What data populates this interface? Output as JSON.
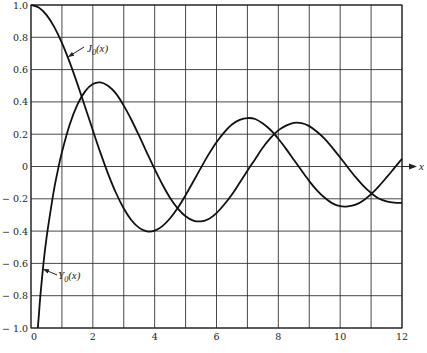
{
  "chart_data": {
    "type": "line",
    "title": "",
    "xlabel": "x",
    "ylabel": "",
    "xlim": [
      0,
      12
    ],
    "ylim": [
      -1.0,
      1.0
    ],
    "grid": true,
    "legend": "none (inline curve labels with arrows)",
    "x_ticks": [
      0,
      1,
      2,
      3,
      4,
      5,
      6,
      7,
      8,
      9,
      10,
      11,
      12
    ],
    "x_tick_labels": [
      "0",
      "",
      "2",
      "",
      "4",
      "",
      "6",
      "",
      "8",
      "",
      "10",
      "",
      "12"
    ],
    "y_ticks": [
      1.0,
      0.8,
      0.6,
      0.4,
      0.2,
      0,
      -0.2,
      -0.4,
      -0.6,
      -0.8,
      -1.0
    ],
    "y_tick_labels": [
      "1.0",
      "0.8",
      "0.6",
      "0.4",
      "0.2",
      "0",
      "− 0.2",
      "− 0.4",
      "− 0.6",
      "− 0.8",
      "− 1.0"
    ],
    "annotations": [
      {
        "text": "J₀(x)",
        "series": "J0",
        "label_pos": [
          87,
          52
        ],
        "arrow_from": [
          84,
          47
        ],
        "arrow_to": [
          68,
          57
        ]
      },
      {
        "text": "Y₀(x)",
        "series": "Y0",
        "label_pos": [
          58,
          279
        ],
        "arrow_from": [
          57,
          275
        ],
        "arrow_to": [
          43,
          269
        ]
      },
      {
        "text": "x",
        "type": "axis-arrow",
        "at_y": 0
      }
    ],
    "series": [
      {
        "name": "J0(x)",
        "x": [
          0,
          0.25,
          0.5,
          0.75,
          1,
          1.25,
          1.5,
          1.75,
          2,
          2.25,
          2.5,
          2.75,
          3,
          3.25,
          3.5,
          3.75,
          4,
          4.25,
          4.5,
          4.75,
          5,
          5.25,
          5.5,
          5.75,
          6,
          6.25,
          6.5,
          6.75,
          7,
          7.25,
          7.5,
          7.75,
          8,
          8.25,
          8.5,
          8.75,
          9,
          9.25,
          9.5,
          9.75,
          10,
          10.25,
          10.5,
          10.75,
          11,
          11.25,
          11.5,
          11.75,
          12
        ],
        "values": [
          1.0,
          0.9844,
          0.9385,
          0.8642,
          0.7652,
          0.6459,
          0.5118,
          0.369,
          0.2239,
          0.0827,
          -0.0484,
          -0.1641,
          -0.2601,
          -0.3328,
          -0.3801,
          -0.4014,
          -0.3971,
          -0.3691,
          -0.3205,
          -0.2551,
          -0.1776,
          -0.0931,
          -0.0068,
          0.0765,
          0.1506,
          0.2118,
          0.2601,
          0.2883,
          0.3001,
          0.2942,
          0.2663,
          0.226,
          0.1717,
          0.1092,
          0.0419,
          -0.0252,
          -0.0903,
          -0.1476,
          -0.1939,
          -0.2284,
          -0.2459,
          -0.2468,
          -0.2366,
          -0.2099,
          -0.1712,
          -0.1227,
          -0.0677,
          -0.0101,
          0.0477
        ]
      },
      {
        "name": "Y0(x)",
        "x": [
          0.22,
          0.25,
          0.3,
          0.4,
          0.5,
          0.625,
          0.75,
          0.875,
          1,
          1.25,
          1.5,
          1.75,
          2,
          2.25,
          2.5,
          2.75,
          3,
          3.25,
          3.5,
          3.75,
          4,
          4.25,
          4.5,
          4.75,
          5,
          5.25,
          5.5,
          5.75,
          6,
          6.25,
          6.5,
          6.75,
          7,
          7.25,
          7.5,
          7.75,
          8,
          8.25,
          8.5,
          8.75,
          9,
          9.25,
          9.5,
          9.75,
          10,
          10.25,
          10.5,
          10.75,
          11,
          11.25,
          11.5,
          11.75,
          12
        ],
        "values": [
          -1.0,
          -0.9316,
          -0.8073,
          -0.606,
          -0.4445,
          -0.2845,
          -0.1372,
          -0.0177,
          0.0883,
          0.2582,
          0.3824,
          0.4654,
          0.5104,
          0.5208,
          0.4981,
          0.451,
          0.3769,
          0.2881,
          0.189,
          0.0849,
          -0.0169,
          -0.1115,
          -0.1947,
          -0.2611,
          -0.3085,
          -0.3346,
          -0.3395,
          -0.3246,
          -0.2882,
          -0.2353,
          -0.1732,
          -0.1004,
          -0.0259,
          0.0454,
          0.1173,
          0.1771,
          0.2235,
          0.2528,
          0.2702,
          0.2683,
          0.2499,
          0.2153,
          0.1712,
          0.1155,
          0.0557,
          -0.0063,
          -0.066,
          -0.1197,
          -0.1637,
          -0.1986,
          -0.2155,
          -0.2234,
          -0.2252
        ]
      }
    ]
  },
  "labels": {
    "j0": "J",
    "j0_sub": "0",
    "j0_arg": "(x)",
    "y0": "Y",
    "y0_sub": "0",
    "y0_arg": "(x)",
    "x_axis": "x"
  },
  "layout": {
    "plot_left": 31,
    "plot_right": 402,
    "plot_top": 5,
    "plot_bottom": 328
  }
}
